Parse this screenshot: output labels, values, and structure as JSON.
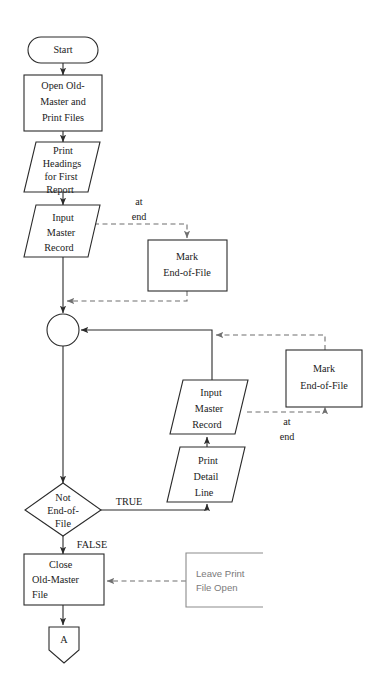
{
  "diagram": {
    "type": "flowchart",
    "colors": {
      "background": "#ffffff",
      "shape_stroke": "#2b2b2b",
      "shape_fill": "#ffffff",
      "solid_connector": "#2b2b2b",
      "dashed_connector": "#6f6f6f",
      "note_stroke": "#8b8b8b",
      "note_text": "#7a7a7a",
      "label_text": "#1a1a1a"
    },
    "nodes": [
      {
        "id": "start",
        "shape": "terminator",
        "lines": [
          "Start"
        ]
      },
      {
        "id": "open-files",
        "shape": "process",
        "lines": [
          "Open Old-",
          "Master and",
          "Print Files"
        ]
      },
      {
        "id": "print-headings",
        "shape": "io-parallelogram",
        "lines": [
          "Print",
          "Headings",
          "for First",
          "Report"
        ]
      },
      {
        "id": "input-master-record-1",
        "shape": "io-parallelogram",
        "lines": [
          "Input",
          "Master",
          "Record"
        ]
      },
      {
        "id": "mark-eof-1",
        "shape": "process",
        "lines": [
          "Mark",
          "End-of-File"
        ]
      },
      {
        "id": "merge-connector",
        "shape": "circle",
        "lines": []
      },
      {
        "id": "mark-eof-2",
        "shape": "process",
        "lines": [
          "Mark",
          "End-of-File"
        ]
      },
      {
        "id": "input-master-record-2",
        "shape": "io-parallelogram",
        "lines": [
          "Input",
          "Master",
          "Record"
        ]
      },
      {
        "id": "print-detail-line",
        "shape": "io-parallelogram",
        "lines": [
          "Print",
          "Detail",
          "Line"
        ]
      },
      {
        "id": "not-end-of-file",
        "shape": "decision",
        "lines": [
          "Not",
          "End-of-",
          "File"
        ]
      },
      {
        "id": "close-old-master",
        "shape": "process",
        "lines": [
          "Close",
          "Old-Master",
          "File"
        ]
      },
      {
        "id": "leave-print-open",
        "shape": "annotation",
        "lines": [
          "Leave Print",
          "File Open"
        ]
      },
      {
        "id": "connector-a",
        "shape": "off-page-connector",
        "lines": [
          "A"
        ]
      }
    ],
    "edge_labels": {
      "at_end_1_line1": "at",
      "at_end_1_line2": "end",
      "at_end_2_line1": "at",
      "at_end_2_line2": "end",
      "decision_true": "TRUE",
      "decision_false": "FALSE"
    }
  }
}
